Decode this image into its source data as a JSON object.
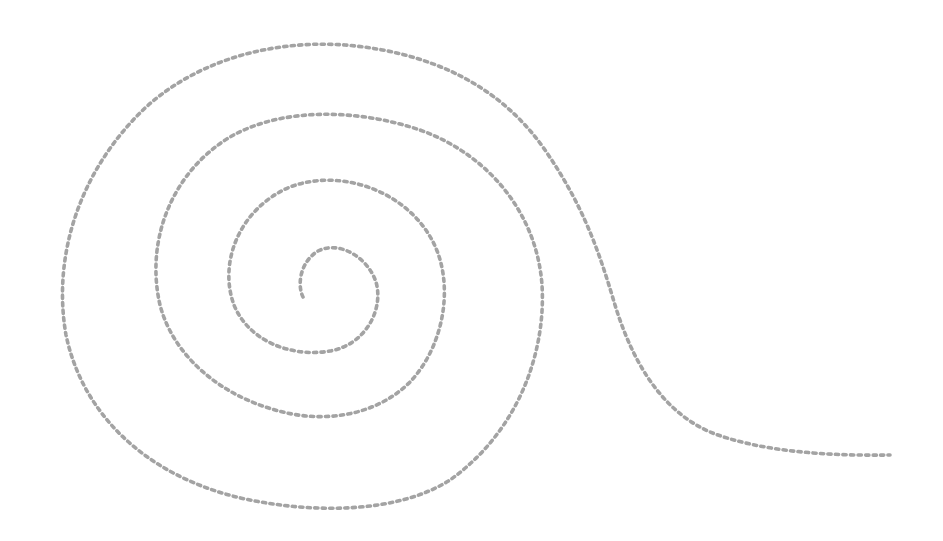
{
  "figure": {
    "type": "spiral",
    "background": "#ffffff",
    "stroke_color": "#a3a3a3",
    "stroke_width": 3.6,
    "dot_length": 3.2,
    "dot_gap": 4.3,
    "center": [
      303,
      297
    ],
    "tail_end": [
      890,
      455
    ]
  }
}
